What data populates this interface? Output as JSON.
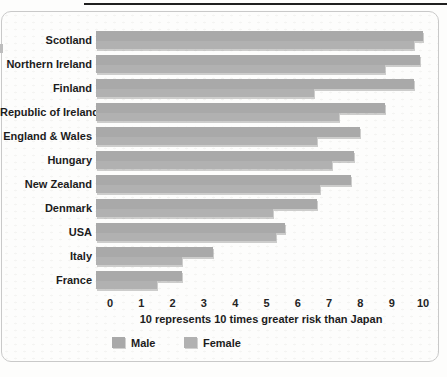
{
  "chart_data": {
    "type": "bar",
    "orientation": "horizontal",
    "categories": [
      "Scotland",
      "Northern Ireland",
      "Finland",
      "Republic of Ireland",
      "England & Wales",
      "Hungary",
      "New Zealand",
      "Denmark",
      "USA",
      "Italy",
      "France"
    ],
    "series": [
      {
        "name": "Male",
        "values": [
          10.0,
          9.9,
          9.7,
          8.8,
          8.0,
          7.8,
          7.7,
          6.6,
          5.6,
          3.3,
          2.3
        ]
      },
      {
        "name": "Female",
        "values": [
          9.7,
          8.8,
          6.5,
          7.3,
          6.6,
          7.1,
          6.7,
          5.2,
          5.3,
          2.3,
          1.5
        ]
      }
    ],
    "x_ticks": [
      0,
      1,
      2,
      3,
      4,
      5,
      6,
      7,
      8,
      9,
      10
    ],
    "xlim": [
      0,
      10
    ],
    "xlabel": "10 represents 10 times greater risk than Japan",
    "title": "",
    "legend_position": "bottom",
    "grid": false,
    "bar_color_male": "#a9a9a9",
    "bar_color_female": "#b1b1b1"
  },
  "legend": {
    "male_label": "Male",
    "female_label": "Female"
  }
}
